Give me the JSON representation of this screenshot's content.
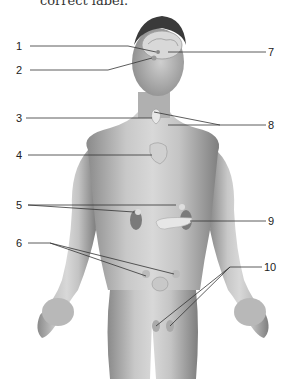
{
  "caption": "correct label.",
  "diagram": {
    "labels": [
      {
        "num": "1",
        "side": "left",
        "x": 16,
        "y": 40
      },
      {
        "num": "2",
        "side": "left",
        "x": 16,
        "y": 64
      },
      {
        "num": "3",
        "side": "left",
        "x": 16,
        "y": 112
      },
      {
        "num": "4",
        "side": "left",
        "x": 16,
        "y": 149
      },
      {
        "num": "5",
        "side": "left",
        "x": 16,
        "y": 199
      },
      {
        "num": "6",
        "side": "left",
        "x": 16,
        "y": 237
      },
      {
        "num": "7",
        "side": "right",
        "x": 268,
        "y": 46
      },
      {
        "num": "8",
        "side": "right",
        "x": 268,
        "y": 119
      },
      {
        "num": "9",
        "side": "right",
        "x": 268,
        "y": 215
      },
      {
        "num": "10",
        "side": "right",
        "x": 264,
        "y": 261
      }
    ]
  }
}
